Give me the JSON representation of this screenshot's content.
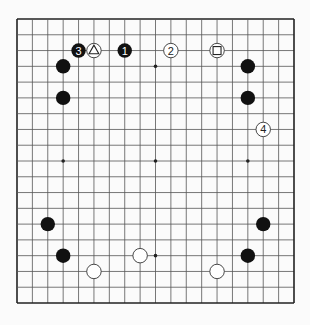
{
  "diagram": {
    "type": "go-board",
    "size": 19,
    "board": {
      "left": 17,
      "top": 19,
      "right": 294,
      "bottom": 303
    },
    "colors": {
      "line": "#555555",
      "border": "#222222",
      "black": "#111111",
      "white": "#ffffff",
      "background": "#fbfbfb"
    },
    "star_points": [
      [
        9,
        3
      ],
      [
        3,
        9
      ],
      [
        9,
        9
      ],
      [
        15,
        9
      ],
      [
        9,
        15
      ]
    ],
    "stones": [
      {
        "color": "black",
        "col": 4,
        "row": 2,
        "label": "3"
      },
      {
        "color": "white",
        "col": 5,
        "row": 2,
        "marker": "triangle"
      },
      {
        "color": "black",
        "col": 7,
        "row": 2,
        "label": "1"
      },
      {
        "color": "white",
        "col": 10,
        "row": 2,
        "label": "2"
      },
      {
        "color": "white",
        "col": 13,
        "row": 2,
        "marker": "square"
      },
      {
        "color": "black",
        "col": 3,
        "row": 3
      },
      {
        "color": "black",
        "col": 3,
        "row": 5
      },
      {
        "color": "black",
        "col": 15,
        "row": 3
      },
      {
        "color": "black",
        "col": 15,
        "row": 5
      },
      {
        "color": "white",
        "col": 16,
        "row": 7,
        "label": "4"
      },
      {
        "color": "black",
        "col": 2,
        "row": 13
      },
      {
        "color": "black",
        "col": 3,
        "row": 15
      },
      {
        "color": "white",
        "col": 5,
        "row": 16
      },
      {
        "color": "white",
        "col": 8,
        "row": 15
      },
      {
        "color": "black",
        "col": 16,
        "row": 13
      },
      {
        "color": "black",
        "col": 15,
        "row": 15
      },
      {
        "color": "white",
        "col": 13,
        "row": 16
      }
    ]
  }
}
